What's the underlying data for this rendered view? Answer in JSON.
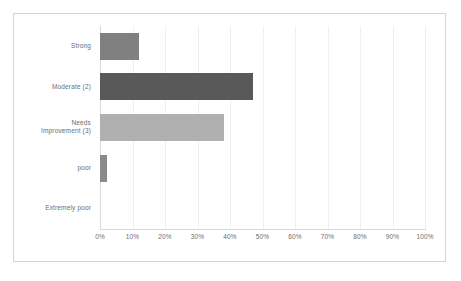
{
  "chart_data": {
    "type": "bar",
    "orientation": "horizontal",
    "title": "",
    "subtitle": "",
    "xlabel": "",
    "ylabel": "",
    "xlim": [
      0,
      100
    ],
    "x_tick_labels": [
      "0%",
      "10%",
      "20%",
      "30%",
      "40%",
      "50%",
      "60%",
      "70%",
      "80%",
      "90%",
      "100%"
    ],
    "x_tick_values": [
      0,
      10,
      20,
      30,
      40,
      50,
      60,
      70,
      80,
      90,
      100
    ],
    "grid": true,
    "legend": "none",
    "categories": [
      "Strong",
      "Moderate (2)",
      "Needs\nImprovement (3)",
      "poor",
      "Extremely poor"
    ],
    "values": [
      12,
      47,
      38,
      2,
      0
    ],
    "value_labels": [
      "12%",
      "47%",
      "38%",
      "2%",
      "0%"
    ],
    "bar_colors": [
      "#808080",
      "#595959",
      "#b0b0b0",
      "#8a8a8a",
      "#8a8a8a"
    ],
    "bars": [
      {
        "category": "Strong",
        "value": 12,
        "color": "#808080"
      },
      {
        "category": "Moderate (2)",
        "value": 47,
        "color": "#595959"
      },
      {
        "category": "Needs\nImprovement (3)",
        "value": 38,
        "color": "#b0b0b0"
      },
      {
        "category": "poor",
        "value": 2,
        "color": "#8a8a8a"
      },
      {
        "category": "Extremely poor",
        "value": 0,
        "color": "#8a8a8a"
      }
    ]
  },
  "style": {
    "frame_border_color": "#d4d4d4",
    "gridline_color": "#f0f0f0",
    "axis_color": "#d9d9d9",
    "tick_text_color": "#6d6d6d",
    "background": "#ffffff"
  }
}
